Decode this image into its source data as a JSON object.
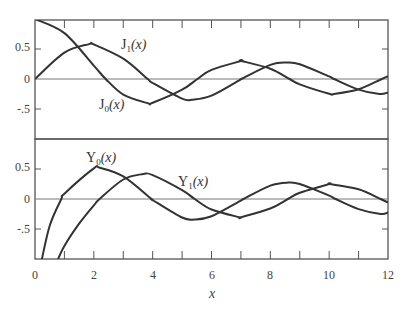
{
  "chart_data": [
    {
      "type": "line",
      "panel": "top",
      "title": "",
      "xlabel": "",
      "ylabel": "",
      "xlim": [
        0,
        12
      ],
      "ylim": [
        -1,
        1
      ],
      "yticks": [
        "0.5",
        "0",
        "-.5"
      ],
      "grid": false,
      "series": [
        {
          "name": "J0(x)",
          "label_main": "J",
          "label_sub": "0",
          "label_arg": "(x)",
          "x": [
            0,
            1,
            2,
            2.405,
            3,
            3.83,
            4,
            5,
            5.52,
            6,
            7,
            7.02,
            8,
            8.65,
            9,
            10,
            10.17,
            11,
            11.79,
            12
          ],
          "y": [
            1,
            0.765,
            0.224,
            0,
            -0.26,
            -0.403,
            -0.397,
            -0.178,
            0,
            0.151,
            0.3,
            0.3,
            0.172,
            0,
            -0.09,
            -0.246,
            -0.25,
            -0.171,
            0,
            0.048
          ]
        },
        {
          "name": "J1(x)",
          "label_main": "J",
          "label_sub": "1",
          "label_arg": "(x)",
          "x": [
            0,
            1,
            1.84,
            2,
            3,
            3.83,
            4,
            5,
            5.33,
            6,
            7,
            7.02,
            8,
            8.54,
            9,
            10,
            10.17,
            11,
            11.71,
            12
          ],
          "y": [
            0,
            0.44,
            0.582,
            0.577,
            0.339,
            0,
            -0.066,
            -0.328,
            -0.346,
            -0.277,
            -0.005,
            0,
            0.235,
            0.273,
            0.245,
            0.043,
            0,
            -0.177,
            -0.25,
            -0.223
          ]
        }
      ]
    },
    {
      "type": "line",
      "panel": "bottom",
      "title": "",
      "xlabel": "x",
      "ylabel": "",
      "xlim": [
        0,
        12
      ],
      "ylim": [
        -1,
        1
      ],
      "xticks": [
        "0",
        "2",
        "4",
        "6",
        "8",
        "10",
        "12"
      ],
      "yticks": [
        "0.5",
        "0",
        "-.5"
      ],
      "grid": false,
      "series": [
        {
          "name": "Y0(x)",
          "label_main": "Y",
          "label_sub": "0",
          "label_arg": "(x)",
          "x": [
            0.2,
            0.5,
            0.894,
            1,
            2,
            2.2,
            3,
            3.96,
            4,
            5,
            5.43,
            6,
            7,
            7.09,
            8,
            8.6,
            9,
            10,
            10.22,
            11,
            11.75,
            12
          ],
          "y": [
            -1.08,
            -0.445,
            0,
            0.088,
            0.51,
            0.521,
            0.377,
            0,
            -0.017,
            -0.309,
            -0.341,
            -0.288,
            -0.026,
            0,
            0.224,
            0.274,
            0.25,
            0.056,
            0,
            -0.169,
            -0.249,
            -0.225
          ]
        },
        {
          "name": "Y1(x)",
          "label_main": "Y",
          "label_sub": "1",
          "label_arg": "(x)",
          "x": [
            0.75,
            1,
            1.5,
            2,
            2.197,
            3,
            3.68,
            4,
            5,
            5.43,
            6,
            6.94,
            7,
            8,
            8.6,
            9,
            10,
            10.02,
            11,
            11.75,
            12
          ],
          "y": [
            -1.04,
            -0.781,
            -0.412,
            -0.107,
            0,
            0.325,
            0.416,
            0.398,
            0.148,
            0,
            -0.175,
            -0.303,
            -0.303,
            -0.158,
            0,
            0.104,
            0.249,
            0.25,
            0.164,
            0,
            -0.057
          ]
        }
      ]
    }
  ],
  "labels": {
    "J0": {
      "main": "J",
      "sub": "0",
      "arg": "(x)"
    },
    "J1": {
      "main": "J",
      "sub": "1",
      "arg": "(x)"
    },
    "Y0": {
      "main": "Y",
      "sub": "0",
      "arg": "(x)"
    },
    "Y1": {
      "main": "Y",
      "sub": "1",
      "arg": "(x)"
    }
  },
  "yticks": {
    "p5": "0.5",
    "z": "0",
    "m5": "-.5"
  },
  "xticks": [
    "0",
    "2",
    "4",
    "6",
    "8",
    "10",
    "12"
  ],
  "xlabel": "x"
}
